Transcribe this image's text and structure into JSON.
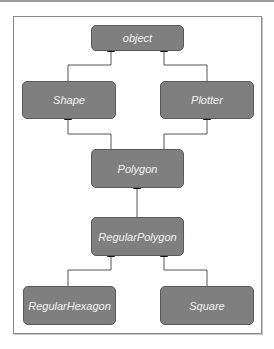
{
  "diagram": {
    "type": "class-inheritance",
    "nodes": {
      "object": "object",
      "shape": "Shape",
      "plotter": "Plotter",
      "polygon": "Polygon",
      "regular_polygon": "RegularPolygon",
      "regular_hexagon": "RegularHexagon",
      "square": "Square"
    },
    "edges": [
      {
        "from": "Shape",
        "to": "object"
      },
      {
        "from": "Plotter",
        "to": "object"
      },
      {
        "from": "Polygon",
        "to": "Shape"
      },
      {
        "from": "Polygon",
        "to": "Plotter"
      },
      {
        "from": "RegularPolygon",
        "to": "Polygon"
      },
      {
        "from": "RegularHexagon",
        "to": "RegularPolygon"
      },
      {
        "from": "Square",
        "to": "RegularPolygon"
      }
    ],
    "colors": {
      "node_fill": "#7f7f7f",
      "node_border": "#5a5a5a",
      "node_text": "#f2f2f2",
      "edge": "#555555"
    }
  }
}
